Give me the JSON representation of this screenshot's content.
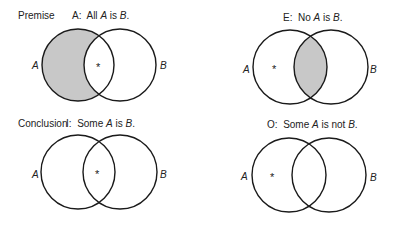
{
  "panels": [
    {
      "id": "A",
      "section_label": "Premise",
      "caption": {
        "letter": "A:",
        "pre": "All ",
        "s": "A",
        "mid": " is ",
        "p": "B",
        "post": "."
      },
      "shaded_region": "A-only",
      "asterisk": "*",
      "left_set": "A",
      "right_set": "B"
    },
    {
      "id": "E",
      "section_label": "",
      "caption": {
        "letter": "E:",
        "pre": "No ",
        "s": "A",
        "mid": " is ",
        "p": "B",
        "post": "."
      },
      "shaded_region": "A-and-B",
      "asterisk": "*",
      "left_set": "A",
      "right_set": "B"
    },
    {
      "id": "I",
      "section_label": "Conclusion",
      "caption": {
        "letter": "I:",
        "pre": "Some ",
        "s": "A",
        "mid": " is ",
        "p": "B",
        "post": "."
      },
      "shaded_region": "none",
      "asterisk": "*",
      "left_set": "A",
      "right_set": "B"
    },
    {
      "id": "O",
      "section_label": "",
      "caption": {
        "letter": "O:",
        "pre": "Some ",
        "s": "A",
        "mid": " is not ",
        "p": "B",
        "post": "."
      },
      "shaded_region": "none",
      "asterisk": "*",
      "left_set": "A",
      "right_set": "B"
    }
  ],
  "colors": {
    "shade": "#c8c8c8",
    "stroke": "#1a1a1a"
  }
}
